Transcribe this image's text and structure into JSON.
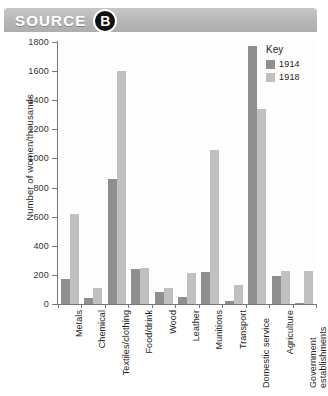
{
  "banner": {
    "label": "SOURCE",
    "badge": "B",
    "bg_color": "#b6b6b6"
  },
  "legend": {
    "title": "Key",
    "entries": [
      {
        "label": "1914",
        "color": "#8f8f8f"
      },
      {
        "label": "1918",
        "color": "#c0c0c0"
      }
    ]
  },
  "chart_data": {
    "type": "bar",
    "title": "",
    "xlabel": "",
    "ylabel": "Number of women/thousands",
    "ylim": [
      0,
      1800
    ],
    "yticks": [
      0,
      200,
      400,
      600,
      800,
      1000,
      1200,
      1400,
      1600,
      1800
    ],
    "grid": false,
    "legend_position": "top-right",
    "categories": [
      "Metals",
      "Chemical",
      "Textiles/clothing",
      "Food/drink",
      "Wood",
      "Leather",
      "Munitions",
      "Transport",
      "Domestic service",
      "Agriculture",
      "Government establishments"
    ],
    "series": [
      {
        "name": "1914",
        "color": "#8f8f8f",
        "values": [
          170,
          40,
          860,
          240,
          80,
          50,
          220,
          20,
          1770,
          190,
          10
        ]
      },
      {
        "name": "1918",
        "color": "#c0c0c0",
        "values": [
          620,
          110,
          1600,
          250,
          110,
          210,
          1060,
          130,
          1340,
          230,
          230
        ]
      }
    ]
  }
}
